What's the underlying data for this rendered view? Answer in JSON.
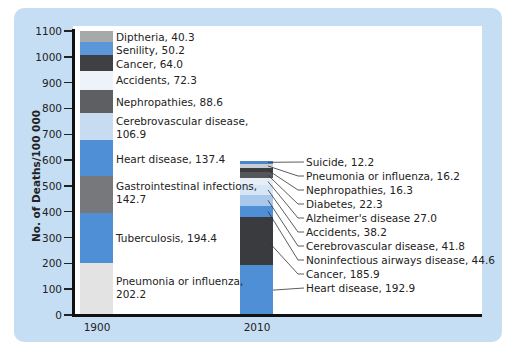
{
  "chart_data": {
    "type": "bar",
    "subtype": "stacked",
    "title": "",
    "xlabel": "",
    "ylabel": "No. of Deaths/100 000",
    "ylim": [
      0,
      1100
    ],
    "yticks": [
      0,
      100,
      200,
      300,
      400,
      500,
      600,
      700,
      800,
      900,
      1000,
      1100
    ],
    "categories": [
      "1900",
      "2010"
    ],
    "grid": false,
    "legend": "inline labels",
    "stacks": {
      "1900": [
        {
          "name": "Pneumonia or influenza",
          "value": 202.2,
          "color": "#e3e3e3"
        },
        {
          "name": "Tuberculosis",
          "value": 194.4,
          "color": "#4f8fd6"
        },
        {
          "name": "Gastrointestinal infections",
          "value": 142.7,
          "color": "#76787c"
        },
        {
          "name": "Heart disease",
          "value": 137.4,
          "color": "#4f8fd6"
        },
        {
          "name": "Cerebrovascular disease",
          "value": 106.9,
          "color": "#c7dcf1"
        },
        {
          "name": "Nephropathies",
          "value": 88.6,
          "color": "#5e5f62"
        },
        {
          "name": "Accidents",
          "value": 72.3,
          "color": "#eef3f9"
        },
        {
          "name": "Cancer",
          "value": 64.0,
          "color": "#3f4043"
        },
        {
          "name": "Senility",
          "value": 50.2,
          "color": "#5b97d8"
        },
        {
          "name": "Diptheria",
          "value": 40.3,
          "color": "#a7a8aa"
        }
      ],
      "2010": [
        {
          "name": "Heart disease",
          "value": 192.9,
          "color": "#4f8fd6"
        },
        {
          "name": "Cancer",
          "value": 185.9,
          "color": "#3a3b3e"
        },
        {
          "name": "Noninfectious airways disease",
          "value": 44.6,
          "color": "#4f8fd6"
        },
        {
          "name": "Cerebrovascular disease",
          "value": 41.8,
          "color": "#a9c8ec"
        },
        {
          "name": "Accidents",
          "value": 38.2,
          "color": "#d7e6f6"
        },
        {
          "name": "Alzheimer's disease",
          "value": 27.0,
          "color": "#e8eef6"
        },
        {
          "name": "Diabetes",
          "value": 22.3,
          "color": "#55575b"
        },
        {
          "name": "Nephropathies",
          "value": 16.3,
          "color": "#3c3d40"
        },
        {
          "name": "Pneumonia or influenza",
          "value": 16.2,
          "color": "#c9ccd1"
        },
        {
          "name": "Suicide",
          "value": 12.2,
          "color": "#4a86cc"
        }
      ]
    }
  },
  "axis": {
    "ylabel": "No. of Deaths/100 000",
    "ticks": [
      "0",
      "100",
      "200",
      "300",
      "400",
      "500",
      "600",
      "700",
      "800",
      "900",
      "1000",
      "1100"
    ],
    "x_labels": [
      "1900",
      "2010"
    ]
  },
  "labels_1900": [
    {
      "line1": "Diptheria, 40.3"
    },
    {
      "line1": "Senility, 50.2"
    },
    {
      "line1": "Cancer, 64.0"
    },
    {
      "line1": "Accidents, 72.3"
    },
    {
      "line1": "Nephropathies, 88.6"
    },
    {
      "line1": "Cerebrovascular disease,",
      "line2": "106.9"
    },
    {
      "line1": "Heart disease, 137.4"
    },
    {
      "line1": "Gastrointestinal infections,",
      "line2": "142.7"
    },
    {
      "line1": "Tuberculosis, 194.4"
    },
    {
      "line1": "Pneumonia or influenza,",
      "line2": "202.2"
    }
  ],
  "labels_2010": [
    "Suicide, 12.2",
    "Pneumonia or influenza, 16.2",
    "Nephropathies, 16.3",
    "Diabetes, 22.3",
    "Alzheimer's disease 27.0",
    "Accidents, 38.2",
    "Cerebrovascular disease, 41.8",
    "Noninfectious airways disease, 44.6",
    "Cancer, 185.9",
    "Heart disease, 192.9"
  ],
  "colors": {
    "panel": "#c6def4",
    "axis": "#111111"
  }
}
